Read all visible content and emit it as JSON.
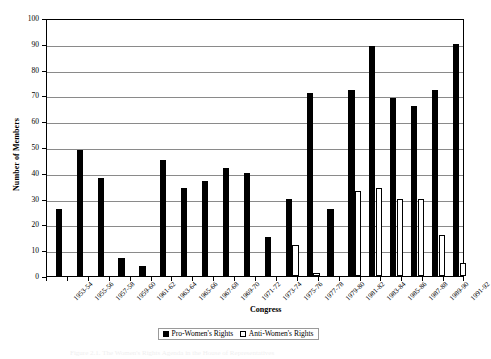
{
  "chart_data": {
    "type": "bar",
    "title": "",
    "xlabel": "Congress",
    "ylabel": "Number of Members",
    "ylim": [
      0,
      100
    ],
    "yticks": [
      0,
      10,
      20,
      30,
      40,
      50,
      60,
      70,
      80,
      90,
      100
    ],
    "grid": true,
    "legend_position": "bottom",
    "categories": [
      "1953-54",
      "1955-56",
      "1957-58",
      "1959-60",
      "1961-62",
      "1963-64",
      "1965-66",
      "1967-68",
      "1969-70",
      "1971-72",
      "1973-74",
      "1975-76",
      "1977-78",
      "1979-80",
      "1981-82",
      "1983-84",
      "1985-86",
      "1987-88",
      "1989-90",
      "1991-92"
    ],
    "series": [
      {
        "name": "Pro-Women's Rights",
        "color": "#000000",
        "values": [
          26,
          49,
          38,
          7,
          4,
          45,
          34,
          37,
          42,
          40,
          15,
          30,
          71,
          26,
          72,
          89,
          69,
          66,
          72,
          90
        ]
      },
      {
        "name": "Anti-Women's Rights",
        "color": "#ffffff",
        "values": [
          0,
          0,
          0,
          0,
          0,
          0,
          0,
          0,
          0,
          0,
          0,
          12,
          1,
          0,
          33,
          34,
          30,
          30,
          16,
          5
        ]
      }
    ]
  },
  "legend": {
    "entries": [
      {
        "label": "Pro-Women's Rights",
        "swatch": "filled-square-black"
      },
      {
        "label": "Anti-Women's Rights",
        "swatch": "open-square-white"
      }
    ]
  },
  "axes": {
    "y_title": "Number of Members",
    "x_title": "Congress"
  },
  "caption": {
    "text": "Figure 2.1. The Women's Rights Agenda in the House of Representatives"
  }
}
